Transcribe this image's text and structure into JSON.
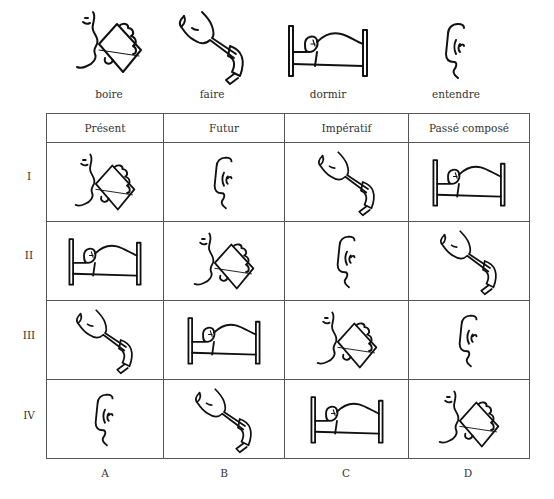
{
  "legend": [
    {
      "icon": "boire",
      "label": "boire"
    },
    {
      "icon": "faire",
      "label": "faire"
    },
    {
      "icon": "dormir",
      "label": "dormir"
    },
    {
      "icon": "entendre",
      "label": "entendre"
    }
  ],
  "table": {
    "headers": [
      "Présent",
      "Futur",
      "Impératif",
      "Passé composé"
    ],
    "rows": [
      {
        "label": "I",
        "cells": [
          "boire",
          "entendre",
          "faire",
          "dormir"
        ]
      },
      {
        "label": "II",
        "cells": [
          "dormir",
          "boire",
          "entendre",
          "faire"
        ]
      },
      {
        "label": "III",
        "cells": [
          "faire",
          "dormir",
          "boire",
          "entendre"
        ]
      },
      {
        "label": "IV",
        "cells": [
          "entendre",
          "faire",
          "dormir",
          "boire"
        ]
      }
    ],
    "column_labels": [
      "A",
      "B",
      "C",
      "D"
    ]
  }
}
